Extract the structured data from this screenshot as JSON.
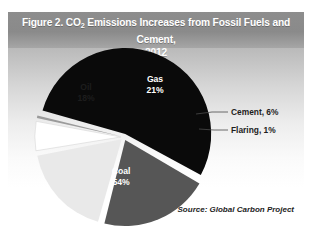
{
  "figure": {
    "title_prefix": "Figure 2. CO",
    "title_sub": "2",
    "title_rest": " Emissions Increases from Fossil Fuels and Cement,",
    "title_year": "2012",
    "source": "Source: Global Carbon Project"
  },
  "chart_data": {
    "type": "pie",
    "title": "Figure 2. CO2 Emissions Increases from Fossil Fuels and Cement, 2012",
    "source": "Source: Global Carbon Project",
    "categories": [
      "Coal",
      "Gas",
      "Oil",
      "Cement",
      "Flaring"
    ],
    "values": [
      54,
      21,
      18,
      6,
      1
    ],
    "unit": "percent",
    "colors": [
      "#0a0a0a",
      "#565656",
      "#e9e9e9",
      "#ffffff",
      "#9b9b9b"
    ],
    "legend": "none",
    "labels": [
      {
        "name": "Coal",
        "text": "Coal",
        "value_text": "54%",
        "placement": "inside",
        "text_color": "#ffffff"
      },
      {
        "name": "Gas",
        "text": "Gas",
        "value_text": "21%",
        "placement": "inside",
        "text_color": "#ffffff"
      },
      {
        "name": "Oil",
        "text": "Oil",
        "value_text": "18%",
        "placement": "inside",
        "text_color": "#1d1d1d"
      },
      {
        "name": "Cement",
        "text": "Cement, 6%",
        "value_text": "6%",
        "placement": "callout",
        "text_color": "#1d1d1d"
      },
      {
        "name": "Flaring",
        "text": "Flaring, 1%",
        "value_text": "1%",
        "placement": "callout",
        "text_color": "#1d1d1d"
      }
    ],
    "exploded": true,
    "start_angle_deg": -75
  }
}
